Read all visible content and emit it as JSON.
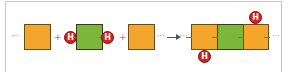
{
  "diagram": {
    "colors": {
      "orange_block": "#f4a52c",
      "green_block": "#7db73a",
      "h_atom": "#d8201c",
      "frame_border": "#c8c8c8"
    },
    "left_side": {
      "leading_dots": "···",
      "plus_1": "+",
      "h_left_label": "H",
      "h_right_label": "H",
      "plus_2": "+",
      "arrow_dots_before": "···",
      "arrow_dots_after": "···"
    },
    "right_side": {
      "blocks": [
        "orange",
        "green",
        "orange"
      ],
      "h_bottom_label": "H",
      "h_top_label": "H",
      "trailing_dots": "···"
    }
  }
}
